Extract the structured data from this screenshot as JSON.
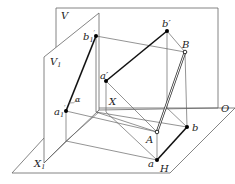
{
  "diagram": {
    "title": "",
    "planes": {
      "V": "V",
      "V1": "V",
      "V1_sub": "1",
      "H": "H"
    },
    "axes": {
      "X": "X",
      "X1": "X",
      "X1_sub": "1",
      "O": "O"
    },
    "points": {
      "b1p": "b",
      "b1p_sub": "1",
      "b1p_mark": "′",
      "a1p": "a",
      "a1p_sub": "1",
      "a1p_mark": "′",
      "bp": "b′",
      "ap": "a′",
      "B": "B",
      "A": "A",
      "b": "b",
      "a": "a"
    },
    "angle": "α",
    "colors": {
      "line": "#555555",
      "thick": "#111111",
      "background": "#ffffff"
    }
  }
}
